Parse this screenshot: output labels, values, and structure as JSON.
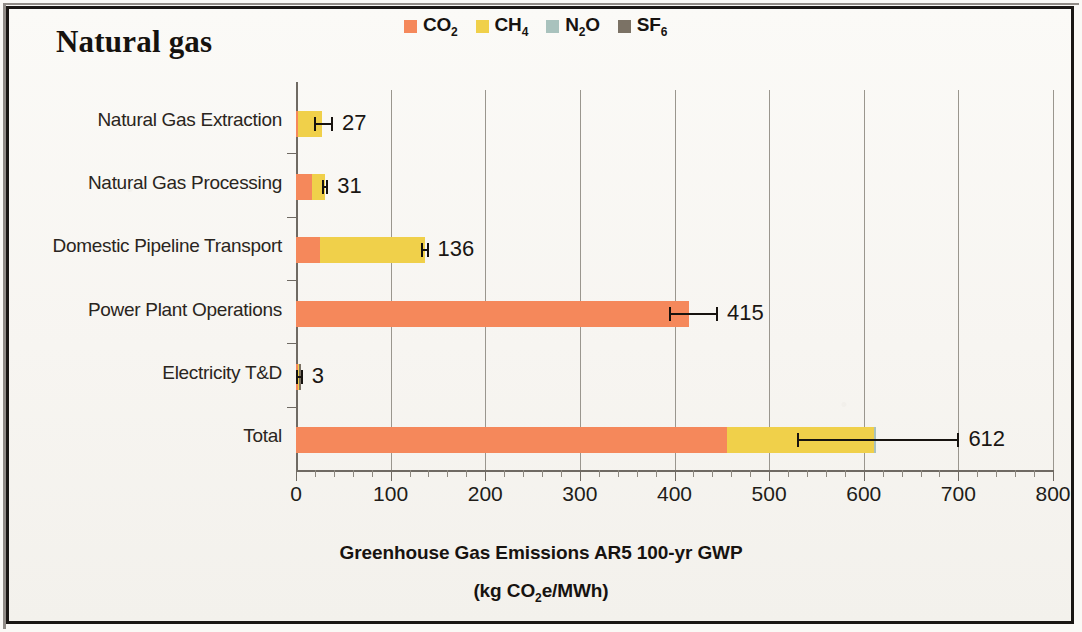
{
  "chart_data": {
    "type": "bar",
    "orientation": "horizontal",
    "stacked": true,
    "title": "Natural gas",
    "xlabel_line1": "Greenhouse Gas Emissions AR5 100-yr GWP",
    "xlabel_line2_prefix": "(kg CO",
    "xlabel_line2_sub": "2",
    "xlabel_line2_suffix": "e/MWh)",
    "ylabel": "",
    "xlim": [
      0,
      800
    ],
    "xticks": [
      0,
      100,
      200,
      300,
      400,
      500,
      600,
      700,
      800
    ],
    "xtick_labels": [
      "0",
      "100",
      "200",
      "300",
      "400",
      "500",
      "600",
      "700",
      "800"
    ],
    "minor_tick_interval": 20,
    "grid": "vertical",
    "legend_position": "top-center",
    "categories": [
      "Natural Gas Extraction",
      "Natural Gas Processing",
      "Domestic Pipeline Transport",
      "Power Plant Operations",
      "Electricity T&D",
      "Total"
    ],
    "series": [
      {
        "name": "CO2",
        "label_prefix": "CO",
        "label_sub": "2",
        "color": "#f5885b",
        "values": [
          2,
          17,
          25,
          415,
          1,
          455
        ]
      },
      {
        "name": "CH4",
        "label_prefix": "CH",
        "label_sub": "4",
        "color": "#f0d04a",
        "values": [
          25,
          14,
          111,
          0,
          1,
          156
        ]
      },
      {
        "name": "N2O",
        "label_prefix": "N",
        "label_sub": "2",
        "label_suffix": "O",
        "color": "#a9c2bd",
        "values": [
          0,
          0,
          0,
          0,
          0,
          1
        ]
      },
      {
        "name": "SF6",
        "label_prefix": "SF",
        "label_sub": "6",
        "color": "#7b7265",
        "values": [
          0,
          0,
          0,
          0,
          1,
          0
        ]
      }
    ],
    "totals": [
      27,
      31,
      136,
      415,
      3,
      612
    ],
    "total_labels": [
      "27",
      "31",
      "136",
      "415",
      "3",
      "612"
    ],
    "error_bars": [
      {
        "category": "Natural Gas Extraction",
        "low": 20,
        "high": 38
      },
      {
        "category": "Natural Gas Processing",
        "low": 29,
        "high": 33
      },
      {
        "category": "Domestic Pipeline Transport",
        "low": 133,
        "high": 139
      },
      {
        "category": "Power Plant Operations",
        "low": 395,
        "high": 445
      },
      {
        "category": "Electricity T&D",
        "low": 1,
        "high": 6
      },
      {
        "category": "Total",
        "low": 530,
        "high": 700
      }
    ]
  },
  "legend": {
    "items": [
      {
        "label_prefix": "CO",
        "label_sub": "2",
        "label_suffix": "",
        "color": "#f5885b",
        "icon": "legend-swatch-co2"
      },
      {
        "label_prefix": "CH",
        "label_sub": "4",
        "label_suffix": "",
        "color": "#f0d04a",
        "icon": "legend-swatch-ch4"
      },
      {
        "label_prefix": "N",
        "label_sub": "2",
        "label_suffix": "O",
        "color": "#a9c2bd",
        "icon": "legend-swatch-n2o"
      },
      {
        "label_prefix": "SF",
        "label_sub": "6",
        "label_suffix": "",
        "color": "#7b7265",
        "icon": "legend-swatch-sf6"
      }
    ]
  },
  "colors": {
    "co2": "#f5885b",
    "ch4": "#f0d04a",
    "n2o": "#a9c2bd",
    "sf6": "#7b7265",
    "grid": "#9a968e",
    "axis": "#6f6a63",
    "text": "#1a1613",
    "background": "#faf9f6",
    "border": "#1a1714"
  }
}
